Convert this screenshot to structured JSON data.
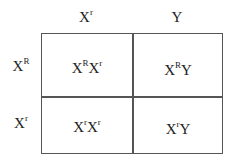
{
  "punnett_square": {
    "column_headers": [
      {
        "base": "X",
        "sup": "r"
      },
      {
        "base": "Y",
        "sup": ""
      }
    ],
    "row_headers": [
      {
        "base": "X",
        "sup": "R"
      },
      {
        "base": "X",
        "sup": "r"
      }
    ],
    "cells": [
      [
        {
          "parts": [
            {
              "base": "X",
              "sup": "R"
            },
            {
              "base": "X",
              "sup": "r"
            }
          ]
        },
        {
          "parts": [
            {
              "base": "X",
              "sup": "R"
            },
            {
              "base": "Y",
              "sup": ""
            }
          ]
        }
      ],
      [
        {
          "parts": [
            {
              "base": "X",
              "sup": "r"
            },
            {
              "base": "X",
              "sup": "r"
            }
          ]
        },
        {
          "parts": [
            {
              "base": "X",
              "sup": "r"
            },
            {
              "base": "Y",
              "sup": ""
            }
          ]
        }
      ]
    ]
  },
  "colors": {
    "line": "#555555",
    "text": "#222222",
    "background": "#ffffff"
  }
}
